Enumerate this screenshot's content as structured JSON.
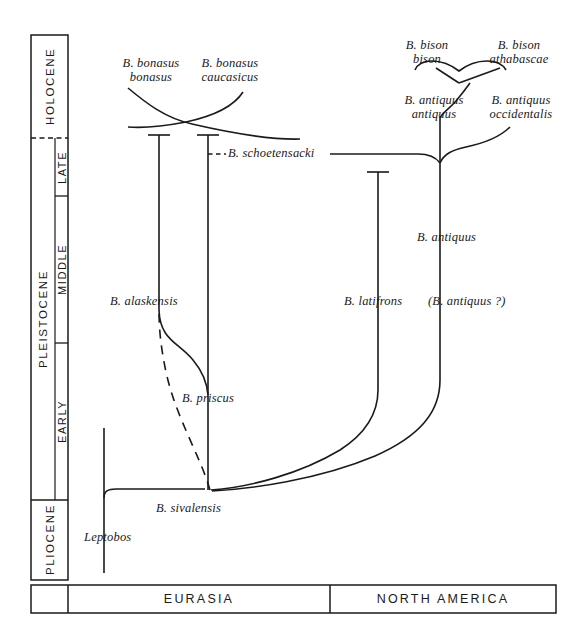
{
  "figure": {
    "frame": {
      "stroke": "#1a1a1a"
    }
  },
  "time_axis": {
    "name": "geologic-time-scale",
    "epochs": [
      {
        "id": "holocene",
        "label": "HOLOCENE",
        "top": 35,
        "bottom": 138
      },
      {
        "id": "pleistocene-late",
        "label": "LATE",
        "top": 138,
        "bottom": 196
      },
      {
        "id": "pleistocene-middle",
        "label": "MIDDLE",
        "top": 196,
        "bottom": 343
      },
      {
        "id": "pleistocene-early",
        "label": "EARLY",
        "top": 343,
        "bottom": 500
      },
      {
        "id": "pliocene",
        "label": "PLIOCENE",
        "top": 500,
        "bottom": 580
      }
    ],
    "super_epoch": {
      "id": "pleistocene",
      "label": "PLEISTOCENE",
      "top": 138,
      "bottom": 500
    }
  },
  "regions": {
    "name": "continent-bar",
    "items": [
      {
        "id": "eurasia",
        "label": "EURASIA",
        "left": 68,
        "right": 330
      },
      {
        "id": "north-america",
        "label": "NORTH AMERICA",
        "left": 330,
        "right": 556
      }
    ],
    "top": 585,
    "bottom": 613
  },
  "taxa": [
    {
      "id": "bonasus-bonasus",
      "label": "B. bonasus\nbonasus",
      "x": 151,
      "y": 62,
      "align": "center"
    },
    {
      "id": "bonasus-caucasicus",
      "label": "B. bonasus\ncaucasicus",
      "x": 230,
      "y": 62,
      "align": "center"
    },
    {
      "id": "schoetensacki",
      "label": "B. schoetensacki",
      "x": 228,
      "y": 146,
      "align": "left"
    },
    {
      "id": "alaskensis",
      "label": "B. alaskensis",
      "x": 110,
      "y": 294,
      "align": "left"
    },
    {
      "id": "priscus",
      "label": "B. priscus",
      "x": 182,
      "y": 391,
      "align": "left"
    },
    {
      "id": "sivalensis",
      "label": "B. sivalensis",
      "x": 156,
      "y": 501,
      "align": "left"
    },
    {
      "id": "leptobos",
      "label": "Leptobos",
      "x": 84,
      "y": 530,
      "align": "left"
    },
    {
      "id": "latifrons",
      "label": "B. latifrons",
      "x": 344,
      "y": 294,
      "align": "left"
    },
    {
      "id": "antiquus-query",
      "label": "(B. antiquus ?)",
      "x": 428,
      "y": 294,
      "align": "left"
    },
    {
      "id": "antiquus",
      "label": "B. antiquus",
      "x": 417,
      "y": 230,
      "align": "left"
    },
    {
      "id": "antiquus-antiquus",
      "label": "B. antiquus\nantiquus",
      "x": 434,
      "y": 99,
      "align": "center"
    },
    {
      "id": "antiquus-occidentalis",
      "label": "B. antiquus\noccidentalis",
      "x": 521,
      "y": 99,
      "align": "center"
    },
    {
      "id": "bison-bison",
      "label": "B. bison\nbison",
      "x": 427,
      "y": 44,
      "align": "center"
    },
    {
      "id": "bison-athabascae",
      "label": "B. bison\nathabascae",
      "x": 519,
      "y": 44,
      "align": "center"
    }
  ],
  "lineages": {
    "priscus_trunk": {
      "x": 208,
      "top": 135,
      "bottom": 490
    },
    "alaskensis_branch": {
      "x": 159,
      "top": 135,
      "bottom": 310
    },
    "latifrons_trunk": {
      "x": 378,
      "top": 172,
      "bottom": 390
    },
    "antiquus_trunk": {
      "x": 440,
      "top": 155,
      "bottom": 380
    },
    "leptobos_trunk": {
      "x": 104,
      "top": 428,
      "bottom": 573
    },
    "sivalensis_node": {
      "x": 210,
      "y": 490
    },
    "antiquus_node": {
      "x": 440,
      "y": 155
    }
  }
}
